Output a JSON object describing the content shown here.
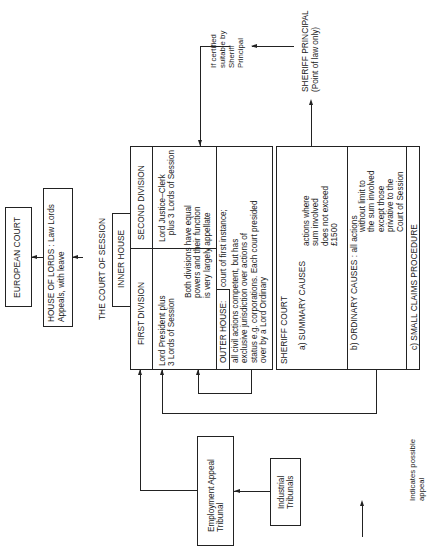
{
  "european_court": {
    "label": "EUROPEAN COURT"
  },
  "house_of_lords": {
    "line1": "HOUSE OF LORDS : Law Lords",
    "line2": "Appeals, with leave"
  },
  "court_of_session": {
    "title": "THE COURT OF SESSION",
    "inner_house": "INNER HOUSE",
    "first_division": {
      "label": "FIRST DIVISION",
      "desc": "Lord President plus\n3 Lords of Session"
    },
    "second_division": {
      "label": "SECOND DIVISION",
      "desc": "Lord Justice–Clerk\n   plus 3 Lords of Session"
    },
    "both_divisions": "Both divisions have equal\npowers and their function\nis very largely appellate",
    "outer_house": {
      "label": "OUTER HOUSE:",
      "desc_first": "court of first instance;",
      "desc": "all civil actions competent, but has\nexclusive jurisdiction over actions of\nstatus e.g. corporations. Each court presided\nover by a Lord Ordinary"
    }
  },
  "sheriff_court": {
    "title": "SHERIFF COURT",
    "summary": {
      "label": "a) SUMMARY CAUSES",
      "desc": "actions where\nsum involved\ndoes not exceed\n£1500"
    },
    "ordinary": {
      "label": "b) ORDINARY CAUSES : all actions",
      "desc": "without limit to\nthe sum involved\nexcept those\nprivative to the\nCourt of Session"
    },
    "small_claims": {
      "label": "c) SMALL CLAIMS PROCEDURE"
    }
  },
  "sheriff_principal": {
    "line1": "SHERIFF PRINCIPAL",
    "line2": "(Point of law only)"
  },
  "certified_note": "If certified\nsuitable by\nSheriff\nPrincipal",
  "employment_appeal_tribunal": {
    "label": "Employment Appeal\nTribunal"
  },
  "industrial_tribunals": {
    "label": "Industrial\nTribunals"
  },
  "legend": {
    "label": "Indicates possible\nappeal"
  }
}
